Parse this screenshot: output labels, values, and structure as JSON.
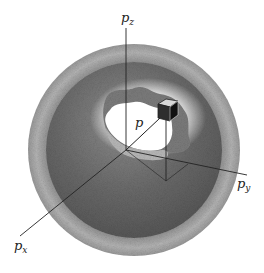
{
  "figure": {
    "type": "momentum-space sphere diagram",
    "axes": {
      "z": {
        "label": "p",
        "subscript": "z"
      },
      "y": {
        "label": "p",
        "subscript": "y"
      },
      "x": {
        "label": "p",
        "subscript": "x"
      }
    },
    "vector_label": "p",
    "colors": {
      "outer_shell": "#a8a8a8",
      "inner_sphere": "#6e6e6e",
      "cavity": "#ffffff",
      "axis": "#222222"
    }
  }
}
